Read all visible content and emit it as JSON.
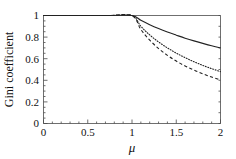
{
  "chart_data": {
    "type": "line",
    "title": "",
    "xlabel": "μ",
    "ylabel": "Gini coefficient",
    "xlim": [
      0,
      2
    ],
    "ylim": [
      0,
      1
    ],
    "xticks": [
      0,
      0.5,
      1,
      1.5,
      2
    ],
    "xtick_labels": [
      "0",
      "0.5",
      "1",
      "1.5",
      "2"
    ],
    "yticks": [
      0,
      0.2,
      0.4,
      0.6,
      0.8,
      1
    ],
    "ytick_labels": [
      "0",
      "0.2",
      "0.4",
      "0.6",
      "0.8",
      "1"
    ],
    "grid": false,
    "legend": "none",
    "x": [
      0,
      0.25,
      0.5,
      0.75,
      1.0,
      1.1,
      1.2,
      1.3,
      1.4,
      1.5,
      1.6,
      1.7,
      1.8,
      1.9,
      2.0
    ],
    "series": [
      {
        "name": "solid",
        "style": "solid",
        "color": "#222222",
        "values": [
          1.0,
          1.0,
          1.0,
          1.0,
          1.0,
          0.955,
          0.915,
          0.879,
          0.847,
          0.818,
          0.79,
          0.765,
          0.742,
          0.72,
          0.7
        ]
      },
      {
        "name": "dotted",
        "style": "dotted",
        "color": "#222222",
        "values": [
          1.0,
          1.0,
          1.0,
          1.0,
          1.0,
          0.9,
          0.82,
          0.755,
          0.7,
          0.652,
          0.61,
          0.572,
          0.538,
          0.508,
          0.48
        ]
      },
      {
        "name": "dashed",
        "style": "dashed",
        "color": "#222222",
        "values": [
          1.0,
          1.0,
          1.0,
          1.0,
          1.0,
          0.87,
          0.772,
          0.694,
          0.631,
          0.578,
          0.533,
          0.494,
          0.46,
          0.43,
          0.403
        ]
      }
    ],
    "annotations": [
      "All three curves coincide at Gini = 1 for mu <= 1",
      "Curves diverge monotonically decreasing for mu > 1"
    ]
  },
  "axes": {
    "y_title": "Gini coefficient",
    "x_title": "μ",
    "x_labels": [
      "0",
      "0.5",
      "1",
      "1.5",
      "2"
    ],
    "y_labels": [
      "0",
      "0.2",
      "0.4",
      "0.6",
      "0.8",
      "1"
    ]
  },
  "colors": {
    "curve": "#222222",
    "frame": "#4a4a4a",
    "background": "#ffffff",
    "text": "#111111"
  }
}
